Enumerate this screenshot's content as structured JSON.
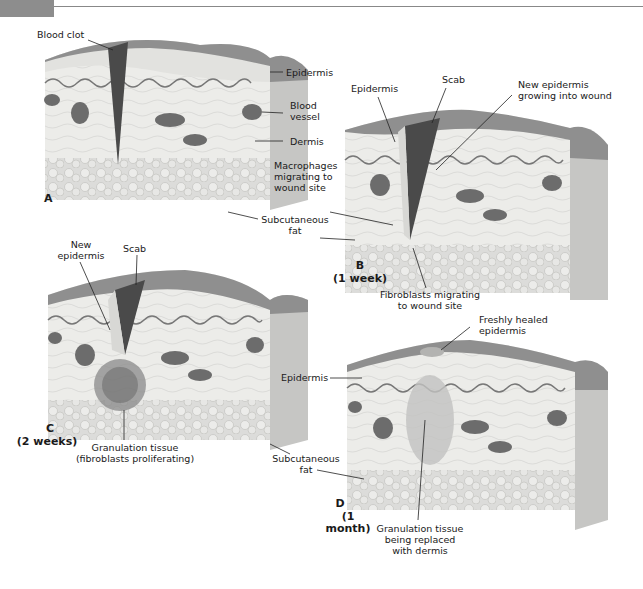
{
  "figure": {
    "panels": [
      {
        "id": "A",
        "letter": "A",
        "time": "",
        "labels": {
          "blood_clot": "Blood clot",
          "epidermis": "Epidermis",
          "blood_vessel": "Blood\nvessel",
          "dermis": "Dermis"
        }
      },
      {
        "id": "B",
        "letter": "B",
        "time": "(1 week)",
        "labels": {
          "epidermis": "Epidermis",
          "scab": "Scab",
          "new_epidermis": "New epidermis\ngrowing into wound",
          "macrophages": "Macrophages\nmigrating to\nwound site",
          "subcutaneous_fat": "Subcutaneous\nfat",
          "fibroblasts": "Fibroblasts migrating\nto wound site"
        }
      },
      {
        "id": "C",
        "letter": "C",
        "time": "(2 weeks)",
        "labels": {
          "new_epidermis": "New\nepidermis",
          "scab": "Scab",
          "granulation": "Granulation tissue\n(fibroblasts proliferating)"
        }
      },
      {
        "id": "D",
        "letter": "D",
        "time": "(1 month)",
        "labels": {
          "freshly_healed": "Freshly healed\nepidermis",
          "epidermis": "Epidermis",
          "subcutaneous_fat": "Subcutaneous\nfat",
          "granulation": "Granulation tissue\nbeing replaced\nwith dermis"
        }
      }
    ]
  },
  "colors": {
    "epidermis_top": "#8f8f8f",
    "block_face": "#e9e9e6",
    "block_side": "#c4c4c2",
    "clot": "#4a4a4a",
    "vessel": "#6c6c6c",
    "fat": "#d7d7d5",
    "line": "#222222"
  }
}
